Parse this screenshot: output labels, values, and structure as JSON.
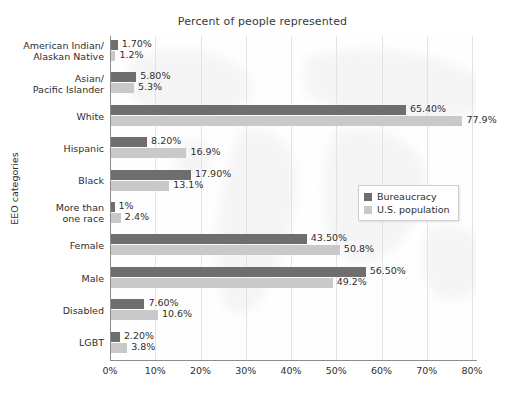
{
  "chart_data": {
    "type": "bar",
    "orientation": "horizontal",
    "title": "Percent of people represented",
    "xlabel": "",
    "ylabel": "EEO categories",
    "xlim": [
      0,
      80
    ],
    "xticks": [
      "0%",
      "10%",
      "20%",
      "30%",
      "40%",
      "50%",
      "60%",
      "70%",
      "80%"
    ],
    "xtick_values": [
      0,
      10,
      20,
      30,
      40,
      50,
      60,
      70,
      80
    ],
    "grid": true,
    "legend_position": "middle-right",
    "categories": [
      "American Indian/\nAlaskan Native",
      "Asian/\nPacific Islander",
      "White",
      "Hispanic",
      "Black",
      "More than\none race",
      "Female",
      "Male",
      "Disabled",
      "LGBT"
    ],
    "series": [
      {
        "name": "Bureaucracy",
        "color": "#6e6e6e",
        "values": [
          1.7,
          5.8,
          65.4,
          8.2,
          17.9,
          1.0,
          43.5,
          56.5,
          7.6,
          2.2
        ],
        "labels": [
          "1.70%",
          "5.80%",
          "65.40%",
          "8.20%",
          "17.90%",
          "1%",
          "43.50%",
          "56.50%",
          "7.60%",
          "2.20%"
        ]
      },
      {
        "name": "U.S. population",
        "color": "#c9c9c9",
        "values": [
          1.2,
          5.3,
          77.9,
          16.9,
          13.1,
          2.4,
          50.8,
          49.2,
          10.6,
          3.8
        ],
        "labels": [
          "1.2%",
          "5.3%",
          "77.9%",
          "16.9%",
          "13.1%",
          "2.4%",
          "50.8%",
          "49.2%",
          "10.6%",
          "3.8%"
        ]
      }
    ]
  }
}
